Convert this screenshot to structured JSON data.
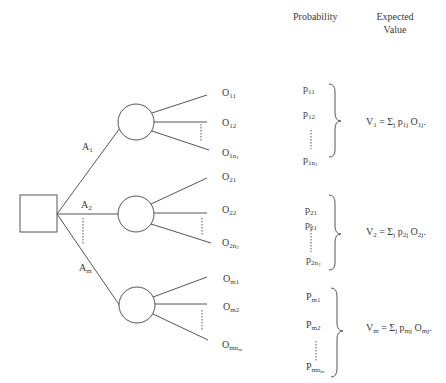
{
  "headers": {
    "probability": "Probability",
    "expected_value_line1": "Expected",
    "expected_value_line2": "Value"
  },
  "decision_node": {
    "shape": "square",
    "label": ""
  },
  "alternatives": [
    {
      "label": "A",
      "sub": "1",
      "outcomes": [
        {
          "base": "O",
          "sub": "11"
        },
        {
          "base": "O",
          "sub": "12"
        },
        {
          "base": "O",
          "sub": "1n",
          "subsub": "1"
        }
      ],
      "probabilities": [
        {
          "base": "p",
          "sub": "11"
        },
        {
          "base": "p",
          "sub": "12"
        },
        {
          "base": "p",
          "sub": "1n",
          "subsub": "1"
        }
      ],
      "expected_value": {
        "lhs": "V",
        "lhs_sub": "1",
        "eq": " = Σ",
        "j": "j",
        "p": " p",
        "p_sub": "1j",
        "o": " O",
        "o_sub": "1j",
        "end": "."
      }
    },
    {
      "label": "A",
      "sub": "2",
      "outcomes": [
        {
          "base": "O",
          "sub": "21"
        },
        {
          "base": "O",
          "sub": "22"
        },
        {
          "base": "O",
          "sub": "2n",
          "subsub": "2"
        }
      ],
      "probabilities": [
        {
          "base": "p",
          "sub": "21"
        },
        {
          "base": "p",
          "sub": "21"
        },
        {
          "base": "p",
          "sub": "2n",
          "subsub": "2"
        }
      ],
      "expected_value": {
        "lhs": "V",
        "lhs_sub": "2",
        "eq": " = Σ",
        "j": "j",
        "p": " p",
        "p_sub": "2j",
        "o": " O",
        "o_sub": "2j",
        "end": "."
      }
    },
    {
      "label": "A",
      "sub": "m",
      "outcomes": [
        {
          "base": "O",
          "sub": "m1"
        },
        {
          "base": "O",
          "sub": "m2"
        },
        {
          "base": "O",
          "sub": "mn",
          "subsub": "m"
        }
      ],
      "probabilities": [
        {
          "base": "P",
          "sub": "m1"
        },
        {
          "base": "P",
          "sub": "m2"
        },
        {
          "base": "P",
          "sub": "mn",
          "subsub": "m"
        }
      ],
      "expected_value": {
        "lhs": "V",
        "lhs_sub": "m",
        "eq": " = Σ",
        "j": "j",
        "p": " p",
        "p_sub": "mj",
        "o": " O",
        "o_sub": "mj",
        "end": "."
      }
    }
  ],
  "colors": {
    "stroke": "#555555",
    "text": "#3a3a3a",
    "background": "#ffffff"
  }
}
